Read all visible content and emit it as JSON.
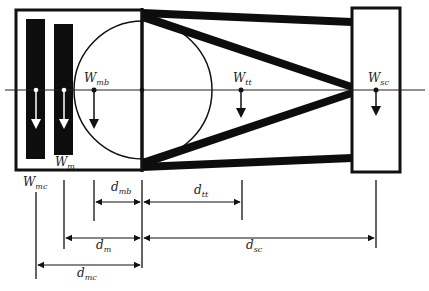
{
  "diagram": {
    "colors": {
      "stroke": "#111111",
      "bar_fill": "#0d0d0d",
      "background": "#ffffff",
      "label": "#222222"
    },
    "weights": [
      {
        "id": "mc",
        "base": "W",
        "sub": "mc",
        "arrow_style": "white-on-black"
      },
      {
        "id": "m",
        "base": "W",
        "sub": "m",
        "arrow_style": "white-on-black"
      },
      {
        "id": "mb",
        "base": "W",
        "sub": "mb",
        "arrow_style": "black"
      },
      {
        "id": "tt",
        "base": "W",
        "sub": "tt",
        "arrow_style": "black"
      },
      {
        "id": "sc",
        "base": "W",
        "sub": "sc",
        "arrow_style": "black"
      }
    ],
    "distances": [
      {
        "id": "mb",
        "base": "d",
        "sub": "mb",
        "from": "W_mb",
        "to": "pivot"
      },
      {
        "id": "tt",
        "base": "d",
        "sub": "tt",
        "from": "pivot",
        "to": "W_tt"
      },
      {
        "id": "m",
        "base": "d",
        "sub": "m",
        "from": "W_m",
        "to": "pivot"
      },
      {
        "id": "sc",
        "base": "d",
        "sub": "sc",
        "from": "pivot",
        "to": "W_sc"
      },
      {
        "id": "mc",
        "base": "d",
        "sub": "mc",
        "from": "W_mc",
        "to": "pivot"
      }
    ]
  }
}
